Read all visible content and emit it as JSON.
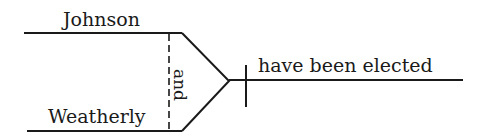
{
  "diagram": {
    "type": "sentence-diagram",
    "compound_subject": {
      "top": "Johnson",
      "bottom": "Weatherly",
      "conjunction": "and"
    },
    "predicate": "have been elected"
  }
}
